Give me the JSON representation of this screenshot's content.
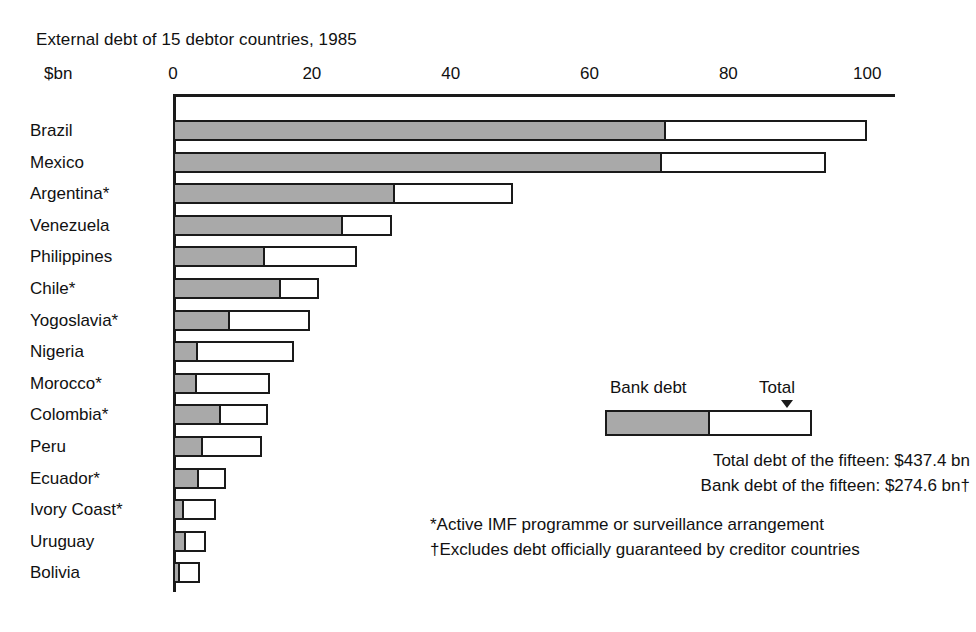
{
  "chart_data": {
    "type": "bar",
    "orientation": "horizontal",
    "stacked": true,
    "title": "External debt of 15 debtor countries, 1985",
    "xlabel": "$bn",
    "ylabel": "",
    "xlim": [
      0,
      104
    ],
    "xticks": [
      0,
      20,
      40,
      60,
      80,
      100
    ],
    "xtick_labels": [
      "0",
      "20",
      "40",
      "60",
      "80",
      "100"
    ],
    "grid": false,
    "legend_position": "inside-right",
    "categories": [
      "Brazil",
      "Mexico",
      "Argentina*",
      "Venezuela",
      "Philippines",
      "Chile*",
      "Yogoslavia*",
      "Nigeria",
      "Morocco*",
      "Colombia*",
      "Peru",
      "Ecuador*",
      "Ivory Coast*",
      "Uruguay",
      "Bolivia"
    ],
    "series": [
      {
        "name": "Bank debt",
        "values": [
          71.0,
          70.5,
          32.0,
          24.5,
          13.2,
          15.6,
          8.2,
          3.6,
          3.4,
          6.9,
          4.3,
          3.8,
          1.6,
          1.9,
          1.0
        ]
      },
      {
        "name": "Total",
        "values": [
          100.0,
          94.0,
          49.0,
          31.5,
          26.5,
          21.0,
          19.8,
          17.5,
          14.0,
          13.7,
          12.8,
          7.7,
          6.2,
          4.8,
          3.9
        ]
      }
    ],
    "annotations": [
      "Total debt of the fifteen: $437.4 bn",
      "Bank debt of the fifteen: $274.6 bn†",
      "*Active IMF programme or surveillance arrangement",
      "†Excludes debt officially guaranteed by creditor countries"
    ],
    "colors": {
      "bank_debt_fill": "#a9a9a9",
      "total_fill": "#ffffff",
      "outline": "#1a1a1a",
      "background": "#ffffff",
      "text": "#111111"
    }
  },
  "legend": {
    "bank_label": "Bank debt",
    "total_label": "Total"
  },
  "summary": {
    "lines": [
      "Total debt of the fifteen: $437.4 bn",
      "Bank debt of the fifteen: $274.6 bn†"
    ]
  },
  "footnotes": {
    "lines": [
      "*Active IMF programme or surveillance arrangement",
      "†Excludes debt officially guaranteed by creditor countries"
    ]
  }
}
